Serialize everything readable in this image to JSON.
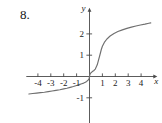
{
  "problem": {
    "number": "8."
  },
  "chart_data": {
    "type": "line",
    "title": "",
    "xlabel": "x",
    "ylabel": "y",
    "grid": false,
    "legend": null,
    "xlim": [
      -4.9,
      4.9
    ],
    "ylim": [
      -2.6,
      3.1
    ],
    "xticks": [
      -4,
      -3,
      -2,
      -1,
      1,
      2,
      3,
      4
    ],
    "xtick_labels": [
      "-4",
      "-3",
      "-2",
      "-1",
      "1",
      "2",
      "3",
      "4"
    ],
    "yticks": [
      -1,
      1,
      2
    ],
    "ytick_labels": [
      "-1",
      "1",
      "2"
    ],
    "series": [
      {
        "name": "curve",
        "color": "#6f6f6f",
        "x": [
          -4.7,
          -4.4,
          -4.1,
          -3.8,
          -3.5,
          -3.2,
          -2.9,
          -2.6,
          -2.3,
          -2.0,
          -1.75,
          -1.5,
          -1.25,
          -1.0,
          -0.8,
          -0.6,
          -0.45,
          -0.32,
          -0.22,
          -0.14,
          -0.08,
          -0.04,
          -0.015,
          0.0,
          0.015,
          0.04,
          0.08,
          0.14,
          0.22,
          0.32,
          0.45,
          0.6,
          0.78,
          0.92,
          1.0,
          1.15,
          1.35,
          1.6,
          1.9,
          2.2,
          2.55,
          2.9,
          3.25,
          3.6,
          3.95,
          4.3,
          4.6,
          4.75
        ],
        "y": [
          -0.82,
          -0.8,
          -0.78,
          -0.76,
          -0.74,
          -0.71,
          -0.68,
          -0.65,
          -0.62,
          -0.58,
          -0.55,
          -0.51,
          -0.47,
          -0.42,
          -0.38,
          -0.34,
          -0.31,
          -0.27,
          -0.23,
          -0.19,
          -0.15,
          -0.1,
          -0.05,
          0.0,
          0.05,
          0.1,
          0.15,
          0.19,
          0.23,
          0.27,
          0.35,
          0.55,
          0.95,
          1.28,
          1.42,
          1.6,
          1.76,
          1.9,
          2.02,
          2.11,
          2.19,
          2.26,
          2.32,
          2.37,
          2.42,
          2.46,
          2.5,
          2.52
        ]
      }
    ]
  }
}
